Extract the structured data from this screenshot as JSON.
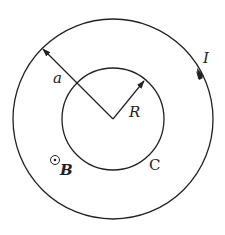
{
  "diagram": {
    "labels": {
      "outer_radius": "a",
      "inner_radius": "R",
      "current": "I",
      "inner_circle": "C",
      "field": "B"
    },
    "symbols": {
      "field_direction": "dot-in-circle (out of page)"
    },
    "colors": {
      "stroke": "#222222",
      "background": "#ffffff"
    }
  }
}
